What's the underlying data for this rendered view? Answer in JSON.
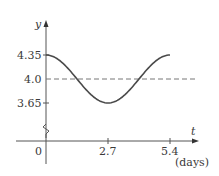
{
  "chart_data": {
    "type": "line",
    "title": "",
    "xlabel": "t",
    "xlabel_unit": "(days)",
    "ylabel": "y",
    "x_ticks": [
      0,
      2.7,
      5.4
    ],
    "x_tick_labels": [
      "0",
      "2.7",
      "5.4"
    ],
    "y_ticks": [
      3.65,
      4.0,
      4.35
    ],
    "y_tick_labels": [
      "3.65",
      "4.0",
      "4.35"
    ],
    "xlim": [
      0,
      5.4
    ],
    "ylim": [
      3.65,
      4.35
    ],
    "y_axis_break": true,
    "grid": false,
    "reference_line": {
      "y": 4.0,
      "style": "dashed"
    },
    "series": [
      {
        "name": "y(t)",
        "formula": "4.0 + 0.35*cos(2*pi*t/5.4)",
        "x": [
          0,
          0.675,
          1.35,
          2.025,
          2.7,
          3.375,
          4.05,
          4.725,
          5.4
        ],
        "values": [
          4.35,
          4.247,
          4.0,
          3.753,
          3.65,
          3.753,
          4.0,
          4.247,
          4.35
        ]
      }
    ]
  },
  "labels": {
    "y_axis": "y",
    "x_axis": "t",
    "x_unit": "(days)",
    "tick_0": "0",
    "tick_2_7": "2.7",
    "tick_5_4": "5.4",
    "tick_435": "4.35",
    "tick_40": "4.0",
    "tick_365": "3.65"
  }
}
